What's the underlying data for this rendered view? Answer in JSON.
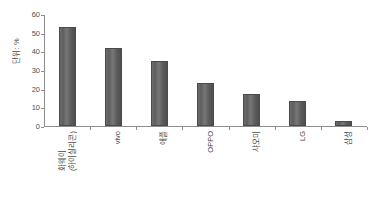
{
  "chart_data": {
    "type": "bar",
    "title": "",
    "xlabel": "",
    "ylabel": "단위: %",
    "ylim": [
      0,
      60
    ],
    "ytick_values": [
      60,
      50,
      40,
      30,
      20,
      10,
      0
    ],
    "ytick_labels": [
      "60",
      "50",
      "40",
      "30",
      "20",
      "10",
      "0"
    ],
    "grid": false,
    "legend": "none",
    "bar_color": "#5e5e5e",
    "categories": [
      "화웨이\n(하이실리콘)",
      "vivo",
      "애플",
      "OPPO",
      "샤오미",
      "LG",
      "삼성"
    ],
    "category_lines": [
      [
        "화웨이",
        "(하이실리콘)"
      ],
      [
        "vivo"
      ],
      [
        "애플"
      ],
      [
        "OPPO"
      ],
      [
        "샤오미"
      ],
      [
        "LG"
      ],
      [
        "삼성"
      ]
    ],
    "values": [
      53,
      42,
      35,
      23,
      17,
      13.5,
      2.5
    ]
  },
  "axis": {
    "y_unit_label": "단위: %"
  }
}
